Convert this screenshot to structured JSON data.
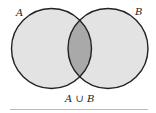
{
  "diagram": {
    "type": "venn",
    "sets": [
      {
        "label": "A",
        "fill": "#e3e3e3"
      },
      {
        "label": "B",
        "fill": "#e3e3e3"
      }
    ],
    "intersection_fill": "#a9a9a9",
    "stroke": "#222222",
    "caption": "A ∪ B"
  }
}
